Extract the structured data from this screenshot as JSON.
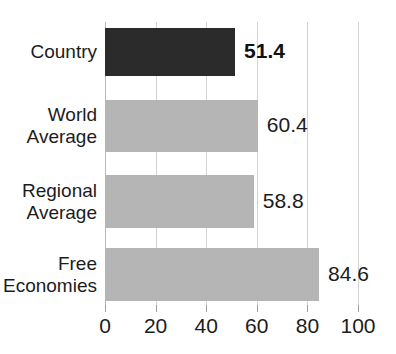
{
  "chart_data": {
    "type": "bar",
    "orientation": "horizontal",
    "title": "",
    "xlabel": "",
    "ylabel": "",
    "xlim": [
      0,
      100
    ],
    "xticks": [
      "0",
      "20",
      "40",
      "60",
      "80",
      "100"
    ],
    "grid": true,
    "legend": "none",
    "categories": [
      "Country",
      "World\nAverage",
      "Regional\nAverage",
      "Free\nEconomies"
    ],
    "values": [
      51.4,
      60.4,
      58.8,
      84.6
    ],
    "value_labels": [
      "51.4",
      "60.4",
      "58.8",
      "84.6"
    ],
    "bar_colors": [
      "#2b2b2b",
      "#b5b5b5",
      "#b5b5b5",
      "#b5b5b5"
    ],
    "highlight_index": 0
  },
  "axis": {
    "ticks": [
      {
        "label": "0",
        "value": 0
      },
      {
        "label": "20",
        "value": 20
      },
      {
        "label": "40",
        "value": 40
      },
      {
        "label": "60",
        "value": 60
      },
      {
        "label": "80",
        "value": 80
      },
      {
        "label": "100",
        "value": 100
      }
    ]
  },
  "bars": [
    {
      "label": "Country",
      "value": 51.4,
      "value_label": "51.4",
      "emphasis": true
    },
    {
      "label": "World\nAverage",
      "value": 60.4,
      "value_label": "60.4",
      "emphasis": false
    },
    {
      "label": "Regional\nAverage",
      "value": 58.8,
      "value_label": "58.8",
      "emphasis": false
    },
    {
      "label": "Free\nEconomies",
      "value": 84.6,
      "value_label": "84.6",
      "emphasis": false
    }
  ],
  "colors": {
    "bar_dark": "#2b2b2b",
    "bar_gray": "#b5b5b5",
    "gridline": "#d2d2d2",
    "text": "#1c1c1c",
    "background": "#ffffff"
  }
}
